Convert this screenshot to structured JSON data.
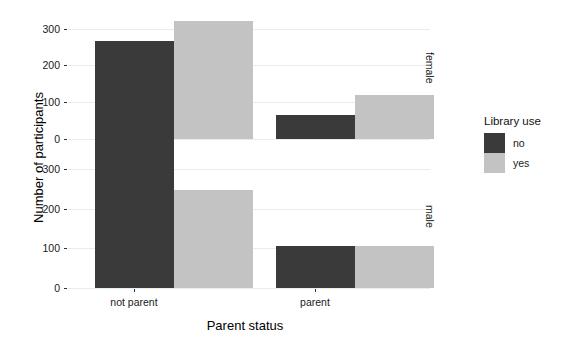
{
  "chart_data": {
    "type": "bar",
    "title": "",
    "xlabel": "Parent status",
    "ylabel": "Number of participants",
    "categories": [
      "not parent",
      "parent"
    ],
    "facets": [
      "female",
      "male"
    ],
    "facet_direction": "rows",
    "legend": {
      "title": "Library use",
      "position": "right",
      "entries": [
        {
          "label": "no",
          "color": "#3a3a3a"
        },
        {
          "label": "yes",
          "color": "#c3c3c3"
        }
      ]
    },
    "yticks": [
      0,
      100,
      200,
      300
    ],
    "ylim": [
      0,
      340
    ],
    "grid": true,
    "panels": [
      {
        "facet": "female",
        "series": [
          {
            "name": "no",
            "color": "#3a3a3a",
            "values": [
              267,
              64
            ]
          },
          {
            "name": "yes",
            "color": "#c3c3c3",
            "values": [
              320,
              119
            ]
          }
        ]
      },
      {
        "facet": "male",
        "series": [
          {
            "name": "no",
            "color": "#3a3a3a",
            "values": [
              384,
              105
            ]
          },
          {
            "name": "yes",
            "color": "#c3c3c3",
            "values": [
              247,
              105
            ]
          }
        ]
      }
    ]
  },
  "axes": {
    "y_title": "Number of participants",
    "x_title": "Parent status",
    "y_tick_labels": [
      "300",
      "200",
      "100",
      "0"
    ],
    "x_tick_labels": [
      "not parent",
      "parent"
    ]
  },
  "strips": {
    "top": "female",
    "bottom": "male"
  },
  "legend": {
    "title": "Library use",
    "item_no": "no",
    "item_yes": "yes"
  },
  "colors": {
    "no": "#3a3a3a",
    "yes": "#c3c3c3",
    "grid": "#ebebeb",
    "background": "#ffffff"
  }
}
